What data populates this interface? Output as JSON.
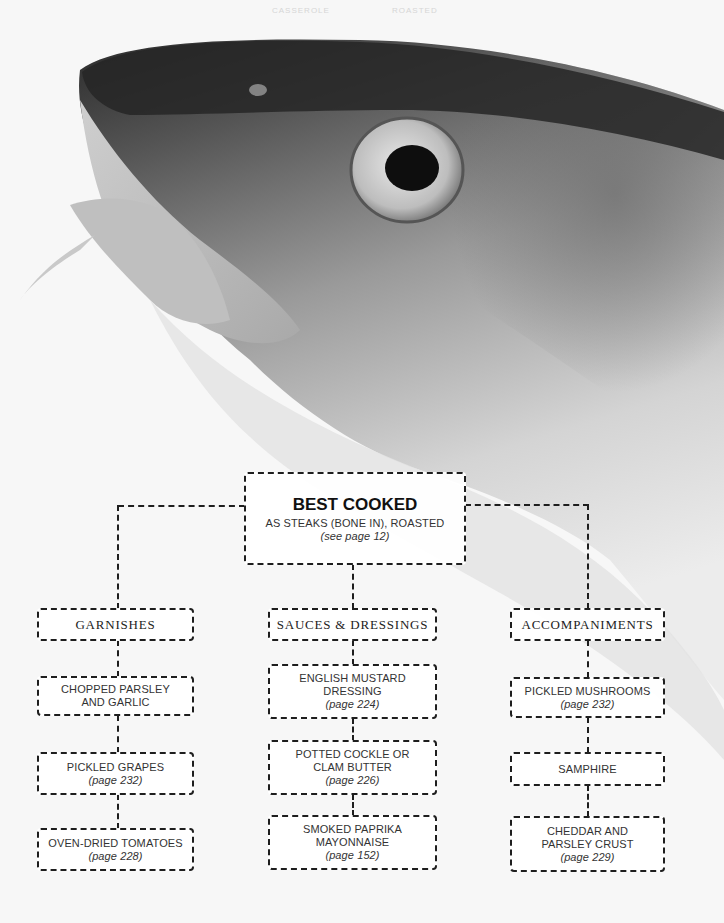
{
  "faint_header": [
    "CASSEROLE",
    "ROASTED"
  ],
  "root": {
    "title": "BEST COOKED",
    "subtitle": "AS STEAKS (BONE IN), ROASTED",
    "ref": "(see page 12)"
  },
  "columns": [
    {
      "heading": "GARNISHES",
      "items": [
        {
          "label": "CHOPPED PARSLEY AND GARLIC",
          "ref": ""
        },
        {
          "label": "PICKLED GRAPES",
          "ref": "(page 232)"
        },
        {
          "label": "OVEN-DRIED TOMATOES",
          "ref": "(page 228)"
        }
      ]
    },
    {
      "heading": "SAUCES & DRESSINGS",
      "items": [
        {
          "label": "ENGLISH MUSTARD DRESSING",
          "ref": "(page 224)"
        },
        {
          "label": "POTTED COCKLE OR CLAM BUTTER",
          "ref": "(page 226)"
        },
        {
          "label": "SMOKED PAPRIKA MAYONNAISE",
          "ref": "(page 152)"
        }
      ]
    },
    {
      "heading": "ACCOMPANIMENTS",
      "items": [
        {
          "label": "PICKLED MUSHROOMS",
          "ref": "(page 232)"
        },
        {
          "label": "SAMPHIRE",
          "ref": ""
        },
        {
          "label": "CHEDDAR AND PARSLEY CRUST",
          "ref": "(page 229)"
        }
      ]
    }
  ],
  "colors": {
    "background": "#f7f7f7",
    "line": "#1e1e1e",
    "text": "#333333",
    "fish_dark": "#2b2b2b",
    "fish_mid": "#8a8a8a",
    "fish_light": "#d9d9d9"
  }
}
